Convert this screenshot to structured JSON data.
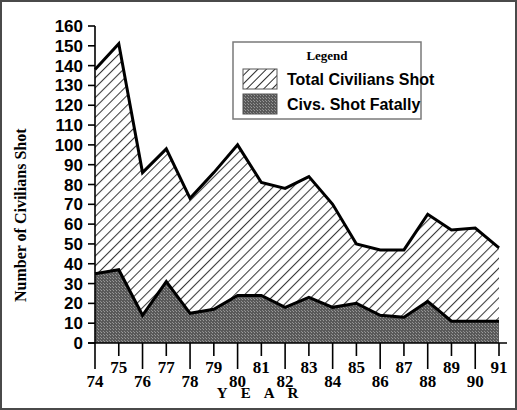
{
  "chart_data": {
    "type": "area",
    "title": "",
    "xlabel": "Y E A R",
    "ylabel": "Number of Civilians Shot",
    "xlim": [
      74,
      91
    ],
    "ylim": [
      0,
      160
    ],
    "ytick_step": 10,
    "grid": false,
    "legend_position": "top-right",
    "legend_title": "Legend",
    "categories": [
      "74",
      "75",
      "76",
      "77",
      "78",
      "79",
      "80",
      "81",
      "82",
      "83",
      "84",
      "85",
      "86",
      "87",
      "88",
      "89",
      "90",
      "91"
    ],
    "yticks": [
      "0",
      "10",
      "20",
      "30",
      "40",
      "50",
      "60",
      "70",
      "80",
      "90",
      "100",
      "110",
      "120",
      "130",
      "140",
      "150",
      "160"
    ],
    "series": [
      {
        "name": "Total Civilians Shot",
        "fill": "diagonal-hatch",
        "color": "#ffffff",
        "values": [
          138,
          151,
          86,
          98,
          73,
          86,
          100,
          81,
          78,
          84,
          70,
          50,
          47,
          47,
          65,
          57,
          58,
          48
        ]
      },
      {
        "name": "Civs. Shot Fatally",
        "fill": "dark-stipple",
        "color": "#595959",
        "values": [
          35,
          37,
          14,
          31,
          15,
          17,
          24,
          24,
          18,
          23,
          18,
          20,
          14,
          13,
          21,
          11,
          11,
          11
        ]
      }
    ]
  },
  "legend": {
    "title": "Legend",
    "items": [
      {
        "label": "Total Civilians Shot",
        "swatch": "hatch-swatch"
      },
      {
        "label": "Civs. Shot Fatally",
        "swatch": "solid-dark-swatch"
      }
    ]
  },
  "axes": {
    "y_title": "Number of Civilians Shot",
    "x_title": "Y E A R"
  },
  "colors": {
    "line": "#000000",
    "fatal_fill": "#595959",
    "total_fill": "#ffffff",
    "frame": "#4a4a4a"
  }
}
